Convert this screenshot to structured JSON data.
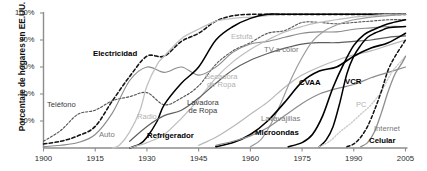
{
  "chart_data": {
    "type": "line",
    "title": "",
    "xlabel": "",
    "ylabel": "Porcentaje de hogares en EE.UU.",
    "xlim": [
      1900,
      2005
    ],
    "ylim": [
      0,
      100
    ],
    "grid": false,
    "legend_position": "inline-labels",
    "xticks": [
      "1900",
      "1915",
      "1930",
      "1945",
      "1960",
      "1975",
      "1990",
      "2005"
    ],
    "xtick_values": [
      1900,
      1915,
      1930,
      1945,
      1960,
      1975,
      1990,
      2005
    ],
    "yticks": [
      "20%",
      "40%",
      "60%",
      "80%",
      "100%"
    ],
    "ytick_values": [
      20,
      40,
      60,
      80,
      100
    ],
    "series": [
      {
        "name": "Electricidad",
        "label": "Electricidad",
        "color": "#141414",
        "style": "dashed",
        "width": 1.6,
        "x": [
          1900,
          1905,
          1910,
          1915,
          1920,
          1925,
          1930,
          1935,
          1940,
          1945,
          1950,
          1955,
          1960,
          1965,
          1970,
          1975,
          1980,
          1985,
          1990,
          1995,
          2000,
          2005
        ],
        "values": [
          3,
          5,
          9,
          16,
          35,
          53,
          68,
          68,
          79,
          85,
          94,
          98,
          99,
          99,
          99,
          99,
          99,
          99,
          99,
          99,
          99,
          99
        ]
      },
      {
        "name": "Telefono",
        "label": "Teléfono",
        "color": "#555555",
        "style": "dashed",
        "width": 1.1,
        "x": [
          1900,
          1905,
          1910,
          1915,
          1920,
          1925,
          1930,
          1935,
          1940,
          1945,
          1950,
          1955,
          1960,
          1965,
          1970,
          1975,
          1980,
          1985,
          1990,
          1995,
          2000,
          2005
        ],
        "values": [
          5,
          13,
          25,
          28,
          35,
          38,
          41,
          32,
          37,
          46,
          62,
          72,
          78,
          85,
          87,
          93,
          93,
          92,
          93,
          94,
          95,
          95
        ]
      },
      {
        "name": "Auto",
        "label": "Auto",
        "color": "#8a8a8a",
        "style": "solid",
        "width": 1.1,
        "x": [
          1900,
          1905,
          1910,
          1915,
          1920,
          1925,
          1930,
          1935,
          1940,
          1945,
          1950,
          1955,
          1960,
          1965,
          1970,
          1975,
          1980,
          1985,
          1990,
          1995,
          2000,
          2005
        ],
        "values": [
          1,
          2,
          4,
          10,
          26,
          50,
          60,
          56,
          60,
          54,
          60,
          71,
          77,
          79,
          82,
          85,
          86,
          86,
          88,
          89,
          90,
          90
        ]
      },
      {
        "name": "Radio",
        "label": "Radio",
        "color": "#c2c2c2",
        "style": "solid",
        "width": 1.3,
        "x": [
          1920,
          1922,
          1925,
          1928,
          1930,
          1933,
          1935,
          1940,
          1945,
          1950,
          1955,
          1960,
          1965,
          1970,
          1975,
          1980,
          1985,
          1990,
          1995,
          2000,
          2005
        ],
        "values": [
          0,
          2,
          12,
          28,
          46,
          62,
          68,
          81,
          88,
          94,
          96,
          97,
          98,
          99,
          99,
          99,
          99,
          99,
          99,
          99,
          99
        ]
      },
      {
        "name": "Refrigerador",
        "label": "Refrigerador",
        "color": "#000000",
        "style": "solid",
        "width": 1.5,
        "x": [
          1925,
          1928,
          1930,
          1933,
          1935,
          1940,
          1945,
          1950,
          1955,
          1960,
          1965,
          1970,
          1975,
          1980,
          1985,
          1990,
          1995,
          2000,
          2005
        ],
        "values": [
          0,
          3,
          8,
          20,
          32,
          48,
          60,
          80,
          90,
          96,
          99,
          99,
          99,
          99,
          99,
          99,
          99,
          99,
          99
        ]
      },
      {
        "name": "Estufa",
        "label": "Estufa",
        "color": "#bdbdbd",
        "style": "solid",
        "width": 1.2,
        "x": [
          1925,
          1930,
          1935,
          1940,
          1945,
          1950,
          1955,
          1960,
          1965,
          1970,
          1975,
          1980,
          1985,
          1990,
          1995,
          2000,
          2005
        ],
        "values": [
          0,
          4,
          10,
          22,
          36,
          52,
          64,
          73,
          80,
          86,
          90,
          93,
          95,
          97,
          98,
          99,
          99
        ]
      },
      {
        "name": "Lavadora de Ropa",
        "label": "Lavadora de Ropa",
        "color": "#5e5e5e",
        "style": "solid",
        "width": 1.2,
        "x": [
          1925,
          1930,
          1935,
          1940,
          1945,
          1950,
          1955,
          1960,
          1965,
          1970,
          1975,
          1980,
          1985,
          1990,
          1995,
          2000,
          2005
        ],
        "values": [
          5,
          16,
          24,
          28,
          37,
          48,
          58,
          65,
          70,
          74,
          77,
          78,
          78,
          79,
          80,
          82,
          83
        ]
      },
      {
        "name": "Secadora de Ropa",
        "label": "Secadora de Ropa",
        "color": "#b8b8b8",
        "style": "solid",
        "width": 1.2,
        "x": [
          1945,
          1950,
          1955,
          1960,
          1965,
          1970,
          1975,
          1980,
          1985,
          1990,
          1995,
          2000,
          2005
        ],
        "values": [
          2,
          8,
          16,
          25,
          34,
          45,
          54,
          60,
          65,
          69,
          72,
          76,
          80
        ]
      },
      {
        "name": "TV a color",
        "label": "TV a color",
        "color": "#9d9d9d",
        "style": "solid",
        "width": 1.2,
        "x": [
          1960,
          1963,
          1966,
          1969,
          1972,
          1975,
          1978,
          1981,
          1984,
          1987,
          1990,
          1995,
          2000,
          2005
        ],
        "values": [
          1,
          6,
          18,
          34,
          52,
          67,
          79,
          86,
          90,
          93,
          95,
          97,
          98,
          99
        ]
      },
      {
        "name": "CVAA",
        "label": "CVAA",
        "color": "#000000",
        "style": "solid",
        "width": 1.6,
        "x": [
          1950,
          1955,
          1960,
          1965,
          1970,
          1975,
          1980,
          1985,
          1990,
          1995,
          2000,
          2005
        ],
        "values": [
          1,
          4,
          10,
          20,
          34,
          49,
          57,
          60,
          68,
          74,
          78,
          85
        ]
      },
      {
        "name": "Lavavajillas",
        "label": "Lavavajillas",
        "color": "#8c8c8c",
        "style": "solid",
        "width": 1.2,
        "x": [
          1950,
          1955,
          1960,
          1965,
          1970,
          1975,
          1980,
          1985,
          1990,
          1995,
          2000,
          2005
        ],
        "values": [
          2,
          5,
          9,
          15,
          24,
          33,
          40,
          44,
          47,
          52,
          56,
          60
        ]
      },
      {
        "name": "Microondas",
        "label": "Microondas",
        "color": "#000000",
        "style": "solid",
        "width": 1.6,
        "x": [
          1971,
          1975,
          1978,
          1981,
          1984,
          1987,
          1990,
          1993,
          1996,
          2000,
          2005
        ],
        "values": [
          1,
          4,
          10,
          24,
          45,
          62,
          76,
          84,
          88,
          92,
          95
        ]
      },
      {
        "name": "VCR",
        "label": "VCR",
        "color": "#000000",
        "style": "solid",
        "width": 1.5,
        "x": [
          1980,
          1982,
          1984,
          1986,
          1988,
          1990,
          1992,
          1994,
          1996,
          1998,
          2000,
          2005
        ],
        "values": [
          1,
          6,
          16,
          34,
          55,
          68,
          76,
          82,
          85,
          87,
          89,
          90
        ]
      },
      {
        "name": "PC",
        "label": "PC",
        "color": "#cbcbcb",
        "style": "dotted",
        "width": 1.4,
        "x": [
          1980,
          1983,
          1986,
          1989,
          1992,
          1995,
          1998,
          2001,
          2004,
          2005
        ],
        "values": [
          1,
          5,
          12,
          18,
          25,
          32,
          42,
          56,
          65,
          68
        ]
      },
      {
        "name": "Internet",
        "label": "Internet",
        "color": "#8e8e8e",
        "style": "solid",
        "width": 1.3,
        "x": [
          1992,
          1994,
          1996,
          1998,
          2000,
          2002,
          2004,
          2005
        ],
        "values": [
          1,
          4,
          12,
          26,
          42,
          55,
          63,
          68
        ]
      },
      {
        "name": "Celular",
        "label": "Celular",
        "color": "#111111",
        "style": "dashed",
        "width": 1.5,
        "x": [
          1988,
          1990,
          1992,
          1994,
          1996,
          1998,
          2000,
          2002,
          2004,
          2005
        ],
        "values": [
          1,
          3,
          8,
          16,
          28,
          42,
          58,
          68,
          76,
          80
        ]
      }
    ]
  }
}
